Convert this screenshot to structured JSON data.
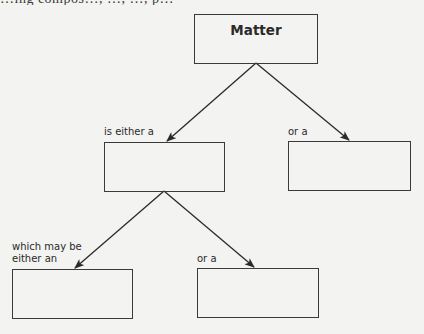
{
  "header": {
    "partial_text": "…ing compos…, …, …, p…"
  },
  "concept_map": {
    "root": {
      "id": "matter",
      "label": "Matter"
    },
    "nodes": [
      {
        "id": "matter",
        "label": "Matter"
      },
      {
        "id": "blank-1",
        "label": ""
      },
      {
        "id": "blank-2",
        "label": ""
      },
      {
        "id": "blank-3",
        "label": ""
      },
      {
        "id": "blank-4",
        "label": ""
      }
    ],
    "edges": [
      {
        "from": "matter",
        "to": "blank-1",
        "label": "is either a"
      },
      {
        "from": "matter",
        "to": "blank-2",
        "label": "or a"
      },
      {
        "from": "blank-1",
        "to": "blank-3",
        "label": "which may be either an"
      },
      {
        "from": "blank-1",
        "to": "blank-4",
        "label": "or a"
      }
    ],
    "link_labels": {
      "is_either_a": "is either a",
      "or_a_right": "or a",
      "which_may_be_line1": "which may be",
      "which_may_be_line2": "either an",
      "or_a_bottom": "or a"
    }
  },
  "colors": {
    "background": "#f3f3f1",
    "ink": "#2a2a2a",
    "box_border": "#3a3a3a"
  }
}
